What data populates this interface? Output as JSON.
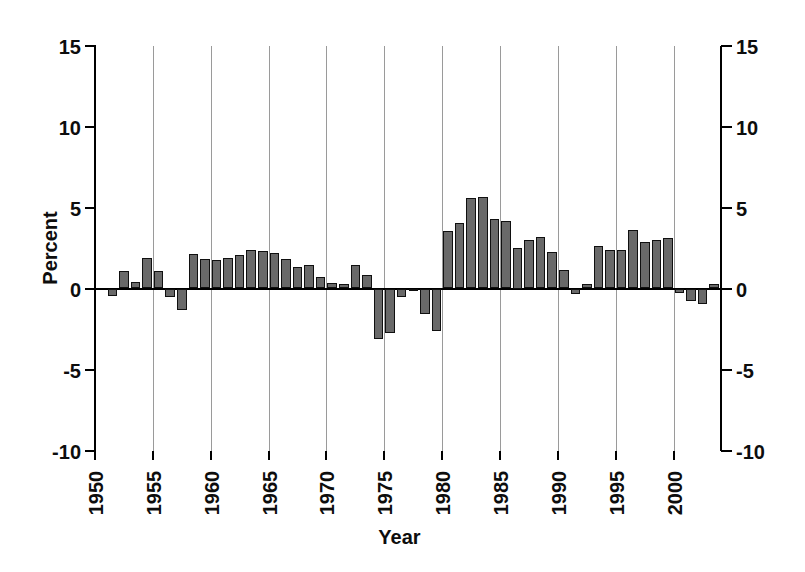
{
  "chart_data": {
    "type": "bar",
    "title": "",
    "xlabel": "Year",
    "ylabel": "Percent",
    "ylim": [
      -10,
      15
    ],
    "xlim": [
      1950,
      2004
    ],
    "y_ticks": [
      15,
      10,
      5,
      0,
      -5,
      -10
    ],
    "x_ticks": [
      1950,
      1955,
      1960,
      1965,
      1970,
      1975,
      1980,
      1985,
      1990,
      1995,
      2000
    ],
    "grid": "vertical-gray-lines-at-x-ticks",
    "legend": "none",
    "years": [
      1951,
      1952,
      1953,
      1954,
      1955,
      1956,
      1957,
      1958,
      1959,
      1960,
      1961,
      1962,
      1963,
      1964,
      1965,
      1966,
      1967,
      1968,
      1969,
      1970,
      1971,
      1972,
      1973,
      1974,
      1975,
      1976,
      1977,
      1978,
      1979,
      1980,
      1981,
      1982,
      1983,
      1984,
      1985,
      1986,
      1987,
      1988,
      1989,
      1990,
      1991,
      1992,
      1993,
      1994,
      1995,
      1996,
      1997,
      1998,
      1999,
      2000,
      2001,
      2002,
      2003
    ],
    "values": [
      -0.45,
      1.05,
      0.4,
      1.9,
      1.05,
      -0.5,
      -1.3,
      2.1,
      1.85,
      1.75,
      1.9,
      2.05,
      2.4,
      2.3,
      2.2,
      1.8,
      1.3,
      1.45,
      0.7,
      0.35,
      0.3,
      1.45,
      0.85,
      -3.1,
      -2.75,
      -0.55,
      -0.15,
      -1.55,
      -2.65,
      3.55,
      4.05,
      5.6,
      5.65,
      4.3,
      4.15,
      2.5,
      3.0,
      3.15,
      2.25,
      1.15,
      -0.35,
      0.25,
      2.6,
      2.4,
      2.4,
      3.6,
      2.9,
      3.0,
      3.1,
      -0.25,
      -0.8,
      -0.95,
      0.3
    ]
  },
  "colors": {
    "bar_fill": "#696969",
    "bar_border": "#101010",
    "gridline": "#9a9a9a",
    "axis": "#000000",
    "background": "#ffffff"
  },
  "layout": {
    "plot_left": 95,
    "plot_top": 45.5,
    "plot_width": 625,
    "plot_height": 405
  }
}
